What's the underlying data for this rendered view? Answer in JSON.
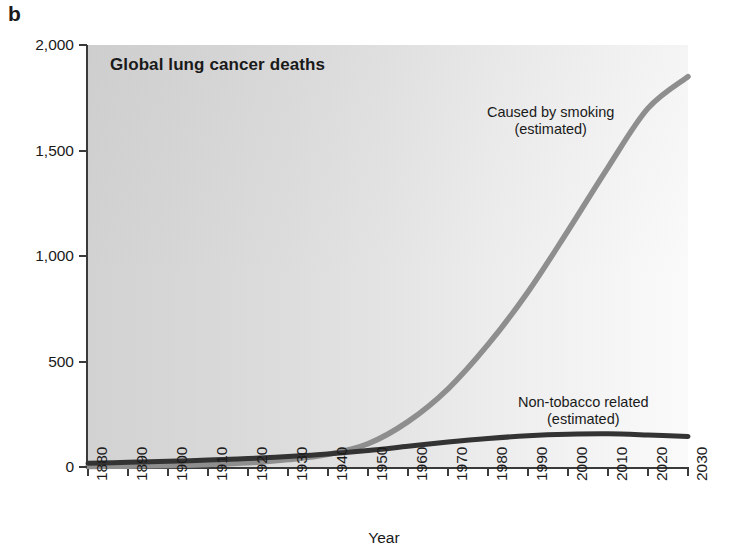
{
  "panel": {
    "letter": "b"
  },
  "axes": {
    "xlabel": "Year",
    "ylabel": "Lung cancer deaths per year (thousands)"
  },
  "chart_data": {
    "type": "line",
    "title": "Global lung cancer deaths",
    "xlabel": "Year",
    "ylabel": "Lung cancer deaths per year (thousands)",
    "xlim": [
      1880,
      2030
    ],
    "ylim": [
      0,
      2000
    ],
    "xticks": [
      1880,
      1890,
      1900,
      1910,
      1920,
      1930,
      1940,
      1950,
      1960,
      1970,
      1980,
      1990,
      2000,
      2010,
      2020,
      2030
    ],
    "xtick_labels": [
      "1880",
      "1890",
      "1900",
      "1910",
      "1920",
      "1930",
      "1940",
      "1950",
      "1960",
      "1970",
      "1980",
      "1990",
      "2000",
      "2010",
      "2020",
      "2030"
    ],
    "yticks": [
      0,
      500,
      1000,
      1500,
      2000
    ],
    "ytick_labels": [
      "0",
      "500",
      "1,000",
      "1,500",
      "2,000"
    ],
    "grid": false,
    "legend": "annotations-on-curve",
    "series": [
      {
        "name": "Caused by smoking (estimated)",
        "label_line1": "Caused by smoking",
        "label_line2": "(estimated)",
        "color": "#8e8e8e",
        "x": [
          1880,
          1890,
          1900,
          1910,
          1920,
          1930,
          1940,
          1950,
          1960,
          1970,
          1980,
          1990,
          2000,
          2010,
          2020,
          2030
        ],
        "values": [
          2,
          4,
          7,
          12,
          20,
          35,
          60,
          110,
          215,
          370,
          580,
          830,
          1120,
          1420,
          1700,
          1850
        ]
      },
      {
        "name": "Non-tobacco related (estimated)",
        "label_line1": "Non-tobacco related",
        "label_line2": "(estimated)",
        "color": "#333333",
        "x": [
          1880,
          1890,
          1900,
          1910,
          1920,
          1930,
          1940,
          1950,
          1960,
          1970,
          1980,
          1990,
          2000,
          2010,
          2020,
          2030
        ],
        "values": [
          18,
          22,
          27,
          33,
          40,
          50,
          62,
          78,
          98,
          118,
          135,
          148,
          155,
          157,
          152,
          145
        ]
      }
    ]
  }
}
